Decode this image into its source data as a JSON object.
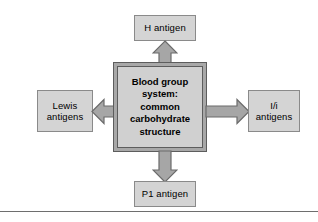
{
  "figure": {
    "kind": "concept-diagram",
    "colors": {
      "node_fill": "#d4d4d4",
      "node_border": "#8a8a8a",
      "center_fill": "#d0d0d0",
      "center_border": "#5d5d5d",
      "center_inner_border": "#a8a8a8",
      "arrow_fill": "#a6a6a6",
      "arrow_border": "#6b6b6b",
      "rule": "#6e6e6e",
      "text": "#000000",
      "background": "#ffffff"
    }
  },
  "center": {
    "label": "Blood group\nsystem:\ncommon\ncarbohydrate\nstructure"
  },
  "nodes": {
    "top": {
      "label": "H antigen"
    },
    "left": {
      "label": "Lewis\nantigens"
    },
    "right": {
      "label": "I/i\nantigens"
    },
    "bottom": {
      "label": "P1 antigen"
    }
  },
  "arrows": {
    "up": {
      "icon": "arrow-up-icon",
      "direction": "up"
    },
    "down": {
      "icon": "arrow-down-icon",
      "direction": "down"
    },
    "left": {
      "icon": "arrow-left-icon",
      "direction": "left"
    },
    "right": {
      "icon": "arrow-right-icon",
      "direction": "right"
    }
  }
}
